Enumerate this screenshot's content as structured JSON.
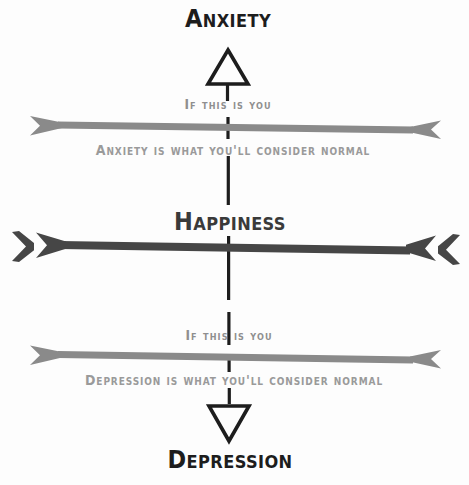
{
  "diagram": {
    "type": "infographic-scale",
    "background_color": "#fdfdfd",
    "center_x": 227,
    "colors": {
      "title_dark": "#1d1d1d",
      "title_mid": "#3a3a3a",
      "bar_gray": "#8a8a8a",
      "bar_dark": "#464646",
      "caption_gray": "#949494",
      "dash_line": "#1d1d1d"
    },
    "top": {
      "title": "Anxiety",
      "marker_icon": "triangle-up-outline",
      "caption_above_bar": "If this is you",
      "caption_below_bar": "Anxiety is what you'll consider normal",
      "bar_color": "#8a8a8a",
      "arrowhead_style": "single"
    },
    "middle": {
      "title": "Happiness",
      "bar_color": "#464646",
      "arrowhead_style": "double-chevron"
    },
    "bottom": {
      "title": "Depression",
      "marker_icon": "triangle-down-outline",
      "caption_above_bar": "If this is you",
      "caption_below_bar": "Depression is what you'll consider normal",
      "bar_color": "#8a8a8a",
      "arrowhead_style": "single"
    }
  }
}
